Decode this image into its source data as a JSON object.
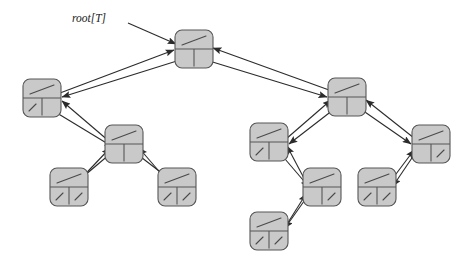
{
  "figure": {
    "width": 472,
    "height": 263,
    "background_color": "#ffffff"
  },
  "labels": {
    "root_pointer": "root[T]"
  },
  "style": {
    "node_fill": "#c9c9c9",
    "node_stroke": "#565656",
    "node_highlight": "#d6d6d6",
    "divider_stroke": "#565656",
    "slash_stroke": "#4a4a4a",
    "edge_stroke": "#2b2b2b",
    "text_color": "#1a1a1a",
    "node_width": 38,
    "node_height": 38,
    "corner_radius": 7
  },
  "nodes": [
    {
      "id": "root",
      "label": "root",
      "x": 175,
      "y": 30,
      "top_slash": true,
      "left_slash": false,
      "right_slash": false
    },
    {
      "id": "n-l",
      "label": "left-child",
      "x": 23,
      "y": 79,
      "top_slash": true,
      "left_slash": true,
      "right_slash": false
    },
    {
      "id": "n-r",
      "label": "right-child",
      "x": 328,
      "y": 78,
      "top_slash": true,
      "left_slash": false,
      "right_slash": false
    },
    {
      "id": "n-lr",
      "label": "left-right-child",
      "x": 105,
      "y": 125,
      "top_slash": true,
      "left_slash": false,
      "right_slash": false
    },
    {
      "id": "n-lrl",
      "label": "left-right-left-leaf",
      "x": 50,
      "y": 168,
      "top_slash": true,
      "left_slash": true,
      "right_slash": true
    },
    {
      "id": "n-lrr",
      "label": "left-right-right-leaf",
      "x": 158,
      "y": 168,
      "top_slash": true,
      "left_slash": true,
      "right_slash": true
    },
    {
      "id": "n-rl",
      "label": "right-left-child",
      "x": 250,
      "y": 123,
      "top_slash": true,
      "left_slash": true,
      "right_slash": false
    },
    {
      "id": "n-rlr",
      "label": "right-left-right-child",
      "x": 303,
      "y": 168,
      "top_slash": true,
      "left_slash": false,
      "right_slash": true
    },
    {
      "id": "n-rlrl",
      "label": "right-left-right-left-leaf",
      "x": 250,
      "y": 212,
      "top_slash": true,
      "left_slash": true,
      "right_slash": true
    },
    {
      "id": "n-rr",
      "label": "right-right-child",
      "x": 412,
      "y": 125,
      "top_slash": true,
      "left_slash": false,
      "right_slash": true
    },
    {
      "id": "n-rrl",
      "label": "right-right-left-leaf",
      "x": 358,
      "y": 168,
      "top_slash": true,
      "left_slash": true,
      "right_slash": true
    }
  ],
  "edges": [
    {
      "name": "root-pointer-arrow",
      "from": [
        128,
        23
      ],
      "to": [
        176,
        44
      ],
      "arrow": "end"
    },
    {
      "name": "root-left-child-edge",
      "from": [
        180,
        60
      ],
      "to": [
        62,
        97
      ],
      "arrow": "end"
    },
    {
      "name": "left-child-parent-edge",
      "from": [
        60,
        93
      ],
      "to": [
        174,
        50
      ],
      "arrow": "end"
    },
    {
      "name": "root-right-child-edge",
      "from": [
        206,
        60
      ],
      "to": [
        327,
        97
      ],
      "arrow": "end"
    },
    {
      "name": "right-child-parent-edge",
      "from": [
        329,
        90
      ],
      "to": [
        213,
        48
      ],
      "arrow": "end"
    },
    {
      "name": "left-to-lr-edge",
      "from": [
        52,
        110
      ],
      "to": [
        113,
        147
      ],
      "arrow": "end"
    },
    {
      "name": "lr-to-left-parent-edge",
      "from": [
        110,
        142
      ],
      "to": [
        62,
        101
      ],
      "arrow": "end"
    },
    {
      "name": "lr-left-child-edge",
      "from": [
        110,
        154
      ],
      "to": [
        78,
        181
      ],
      "arrow": "end"
    },
    {
      "name": "lrl-parent-edge",
      "from": [
        75,
        185
      ],
      "to": [
        110,
        148
      ],
      "arrow": "end"
    },
    {
      "name": "lr-right-child-edge",
      "from": [
        137,
        154
      ],
      "to": [
        172,
        181
      ],
      "arrow": "end"
    },
    {
      "name": "lrr-parent-edge",
      "from": [
        170,
        184
      ],
      "to": [
        139,
        148
      ],
      "arrow": "end"
    },
    {
      "name": "right-left-child-edge",
      "from": [
        333,
        110
      ],
      "to": [
        289,
        144
      ],
      "arrow": "end"
    },
    {
      "name": "rl-parent-edge",
      "from": [
        286,
        139
      ],
      "to": [
        331,
        100
      ],
      "arrow": "end"
    },
    {
      "name": "right-right-child-edge",
      "from": [
        362,
        110
      ],
      "to": [
        411,
        144
      ],
      "arrow": "end"
    },
    {
      "name": "rr-parent-edge",
      "from": [
        414,
        138
      ],
      "to": [
        366,
        100
      ],
      "arrow": "end"
    },
    {
      "name": "rl-right-child-edge",
      "from": [
        279,
        152
      ],
      "to": [
        309,
        187
      ],
      "arrow": "end"
    },
    {
      "name": "rlr-parent-edge",
      "from": [
        306,
        182
      ],
      "to": [
        287,
        146
      ],
      "arrow": "end"
    },
    {
      "name": "rlr-left-child-edge",
      "from": [
        307,
        197
      ],
      "to": [
        285,
        228
      ],
      "arrow": "end"
    },
    {
      "name": "rlrl-parent-edge",
      "from": [
        282,
        232
      ],
      "to": [
        306,
        194
      ],
      "arrow": "end"
    },
    {
      "name": "rr-left-child-edge",
      "from": [
        416,
        152
      ],
      "to": [
        393,
        186
      ],
      "arrow": "end"
    },
    {
      "name": "rrl-parent-edge",
      "from": [
        390,
        182
      ],
      "to": [
        414,
        150
      ],
      "arrow": "end"
    }
  ]
}
